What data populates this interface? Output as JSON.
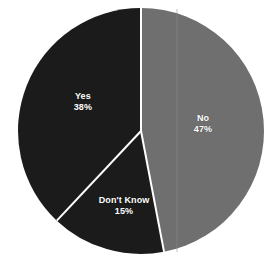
{
  "chart_data": {
    "type": "pie",
    "title": "",
    "subtitle": "",
    "xlabel": "",
    "ylabel": "",
    "legend_position": "none",
    "grid": false,
    "labels_inside_slices": true,
    "categories": [
      "No",
      "Don't Know",
      "Yes"
    ],
    "values": [
      47,
      15,
      38
    ],
    "unit": "%",
    "start_angle_deg": 0,
    "direction": "clockwise",
    "slices": [
      {
        "name": "No",
        "value": 47,
        "value_label": "47%",
        "color": "#6f6f6f",
        "start_deg": 0.0,
        "end_deg": 169.2,
        "label_x_pct": 72.5,
        "label_y_pct": 47.5
      },
      {
        "name": "Don't Know",
        "value": 15,
        "value_label": "15%",
        "color": "#1b1b1b",
        "start_deg": 169.2,
        "end_deg": 223.2,
        "label_x_pct": 44.3,
        "label_y_pct": 78.5
      },
      {
        "name": "Yes",
        "value": 38,
        "value_label": "38%",
        "color": "#1b1b1b",
        "start_deg": 223.2,
        "end_deg": 360.0,
        "label_x_pct": 29.6,
        "label_y_pct": 39.1
      }
    ],
    "geometry": {
      "center_x": 141,
      "center_y": 131,
      "radius": 123,
      "separator_color": "#ffffff",
      "separator_width": 2
    },
    "colors": {
      "background": "#ffffff",
      "dark_slice": "#1b1b1b",
      "gray_slice": "#6f6f6f",
      "label_text": "#ffffff",
      "divider": "#ffffff"
    }
  }
}
